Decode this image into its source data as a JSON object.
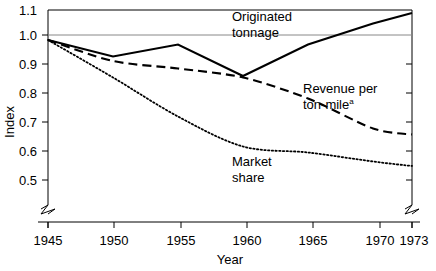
{
  "chart_data": {
    "type": "line",
    "title": "",
    "xlabel": "Year",
    "ylabel": "Index",
    "xlim": [
      1945,
      1973
    ],
    "ylim": [
      0.45,
      1.1
    ],
    "grid": false,
    "reference_line": 1.0,
    "legend_position": "inline-annotations",
    "x_ticks": [
      1945,
      1950,
      1955,
      1960,
      1965,
      1970,
      1973
    ],
    "x_tick_labels": [
      "1945",
      "1950",
      "1955",
      "1960",
      "1965",
      "1970",
      "1973"
    ],
    "y_ticks": [
      0.5,
      0.6,
      0.7,
      0.8,
      0.9,
      1.0,
      1.1
    ],
    "y_tick_labels": [
      "0.5",
      "0.6",
      "0.7",
      "0.8",
      "0.9",
      "1.0",
      "1.1"
    ],
    "axis_break_x": true,
    "axis_break_y": true,
    "x": [
      1945,
      1950,
      1955,
      1960,
      1965,
      1970,
      1973
    ],
    "series": [
      {
        "name": "Originated tonnage",
        "style": "solid",
        "label_line1": "Originated",
        "label_line2": "tonnage",
        "values": [
          1.0,
          0.945,
          0.985,
          0.88,
          0.985,
          1.055,
          1.09
        ]
      },
      {
        "name": "Revenue per ton-mile",
        "style": "dashed",
        "label_line1": "Revenue per",
        "label_line2": "ton-mile",
        "label_superscript": "a",
        "values": [
          1.0,
          0.93,
          0.905,
          0.875,
          0.805,
          0.705,
          0.685
        ]
      },
      {
        "name": "Market share",
        "style": "dotted",
        "label_line1": "Market",
        "label_line2": "share",
        "values": [
          1.0,
          0.875,
          0.745,
          0.645,
          0.625,
          0.595,
          0.58
        ]
      }
    ]
  },
  "axes": {
    "y_title": "Index",
    "x_title": "Year"
  }
}
